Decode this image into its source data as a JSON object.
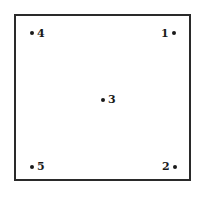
{
  "diagram": {
    "frame": {
      "shape": "square",
      "border_color": "#2a2a2a"
    },
    "points": [
      {
        "label": "1",
        "position": "top-right"
      },
      {
        "label": "2",
        "position": "bottom-right"
      },
      {
        "label": "3",
        "position": "center"
      },
      {
        "label": "4",
        "position": "top-left"
      },
      {
        "label": "5",
        "position": "bottom-left"
      }
    ]
  }
}
